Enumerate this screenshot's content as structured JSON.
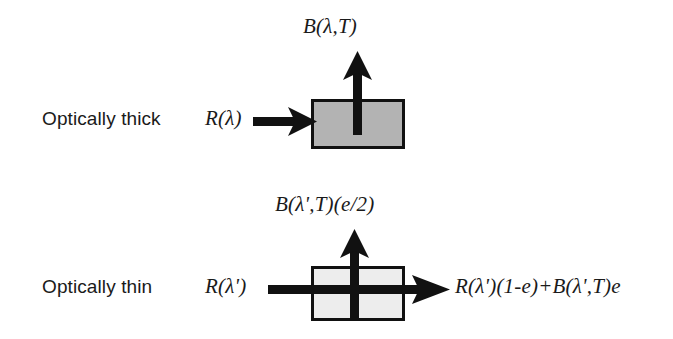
{
  "figure": {
    "background_color": "#ffffff",
    "ink_color": "#111111"
  },
  "panels": [
    {
      "id": "optically-thick",
      "row_label": "Optically thick",
      "incoming_label": "R(λ)",
      "emitted_label": "B(λ,T)",
      "outgoing_label": "",
      "box": {
        "fill_color": "#b3b3b3",
        "border_color": "#111111",
        "x": 311,
        "y": 99,
        "width": 94,
        "height": 50
      },
      "arrows": [
        {
          "name": "incoming-arrow",
          "direction": "right"
        },
        {
          "name": "emitted-arrow",
          "direction": "up"
        }
      ]
    },
    {
      "id": "optically-thin",
      "row_label": "Optically thin",
      "incoming_label": "R(λ')",
      "emitted_label": "B(λ',T)(e/2)",
      "outgoing_label": "R(λ')(1-e)+B(λ',T)e",
      "box": {
        "fill_color": "#ededed",
        "border_color": "#111111",
        "x": 311,
        "y": 266,
        "width": 94,
        "height": 55
      },
      "arrows": [
        {
          "name": "transmitted-arrow",
          "direction": "right"
        },
        {
          "name": "emitted-arrow",
          "direction": "up"
        }
      ]
    }
  ]
}
